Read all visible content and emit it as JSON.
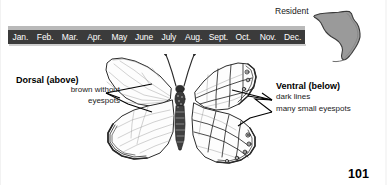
{
  "page": {
    "number": "101",
    "background_color": "#ffffff"
  },
  "flight_period": {
    "bar_color": "#3b3b3b",
    "text_color": "#ffffff",
    "highlight_color": "#b9b9b9",
    "months": [
      "Jan.",
      "Feb.",
      "Mar.",
      "Apr.",
      "May",
      "June",
      "July",
      "Aug.",
      "Sept.",
      "Oct.",
      "Nov.",
      "Dec."
    ]
  },
  "range": {
    "status_label": "Resident",
    "map_name": "florida-state-map",
    "map_fill": "#9a9a9a",
    "map_stroke": "#3a3a3a"
  },
  "specimen": {
    "name": "butterfly-specimen-illustration",
    "dorsal_view": "dorsal-wings-left",
    "ventral_view": "ventral-wings-right"
  },
  "annotations": {
    "dorsal": {
      "heading": "Dorsal (above)",
      "lines": [
        "brown without",
        "eyespots"
      ]
    },
    "ventral": {
      "heading": "Ventral (below)",
      "lines": [
        "dark lines",
        "many small eyespots"
      ]
    }
  }
}
